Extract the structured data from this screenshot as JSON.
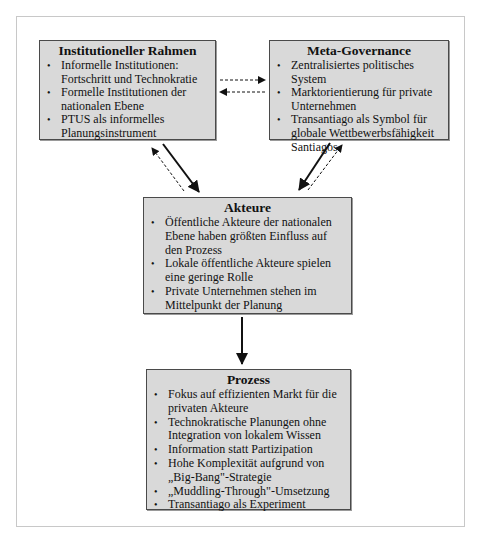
{
  "diagram": {
    "boxes": {
      "institutional": {
        "title": "Institutioneller Rahmen",
        "items": [
          "Informelle Institutionen: Fortschritt und Technokratie",
          "Formelle Institutionen der nationalen Ebene",
          "PTUS als informelles Planungsinstrument"
        ]
      },
      "meta": {
        "title": "Meta-Governance",
        "items": [
          "Zentralisiertes politisches System",
          "Marktorientierung für private Unternehmen",
          "Transantiago als Symbol für globale Wettbewerbsfähigkeit Santiagos"
        ]
      },
      "akteure": {
        "title": "Akteure",
        "items": [
          "Öffentliche Akteure der nationalen Ebene haben größten Einfluss auf den Prozess",
          "Lokale öffentliche Akteure spielen eine geringe Rolle",
          "Private Unternehmen stehen im Mittelpunkt der Planung"
        ]
      },
      "prozess": {
        "title": "Prozess",
        "items": [
          "Fokus auf effizienten Markt für die privaten Akteure",
          "Technokratische Planungen ohne Integration von lokalem Wissen",
          "Information statt Partizipation",
          "Hohe Komplexität aufgrund von „Big-Bang\"-Strategie",
          "„Muddling-Through\"-Umsetzung",
          "Transantiago als Experiment"
        ]
      }
    },
    "edges": [
      {
        "from": "institutional",
        "to": "meta",
        "style": "dashed"
      },
      {
        "from": "meta",
        "to": "institutional",
        "style": "dashed"
      },
      {
        "from": "institutional",
        "to": "akteure",
        "style": "solid"
      },
      {
        "from": "akteure",
        "to": "institutional",
        "style": "dashed"
      },
      {
        "from": "meta",
        "to": "akteure",
        "style": "solid"
      },
      {
        "from": "akteure",
        "to": "meta",
        "style": "dashed"
      },
      {
        "from": "akteure",
        "to": "prozess",
        "style": "solid"
      }
    ],
    "colors": {
      "box_fill": "#d9d9d9",
      "box_border": "#4a4a4a",
      "arrow": "#111111",
      "frame": "#c8c8c8"
    }
  }
}
